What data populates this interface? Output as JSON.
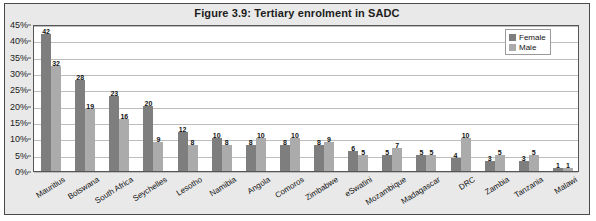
{
  "figure": {
    "title": "Figure 3.9: Tertiary enrolment in SADC"
  },
  "legend": {
    "position": "top-right",
    "entries": [
      {
        "label": "Female",
        "color": "#7e7e7e"
      },
      {
        "label": "Male",
        "color": "#ababab"
      }
    ]
  },
  "axis": {
    "y_ticks": [
      "0%",
      "5%",
      "10%",
      "15%",
      "20%",
      "25%",
      "30%",
      "35%",
      "40%",
      "45%"
    ]
  },
  "chart_data": {
    "type": "bar",
    "title": "Figure 3.9: Tertiary enrolment in SADC",
    "xlabel": "",
    "ylabel": "",
    "ylim": [
      0,
      45
    ],
    "ytick_step": 5,
    "ytick_suffix": "%",
    "grid": true,
    "legend_position": "top-right",
    "categories": [
      "Mauritius",
      "Botswana",
      "South Africa",
      "Seychelles",
      "Lesotho",
      "Namibia",
      "Angola",
      "Comoros",
      "Zimbabwe",
      "eSwatini",
      "Mozambique",
      "Madagascar",
      "DRC",
      "Zambia",
      "Tanzania",
      "Malawi"
    ],
    "series": [
      {
        "name": "Female",
        "color": "#7e7e7e",
        "values": [
          42,
          28,
          23,
          20,
          12,
          10,
          8,
          8,
          8,
          6,
          5,
          5,
          4,
          3,
          3,
          1
        ]
      },
      {
        "name": "Male",
        "color": "#ababab",
        "values": [
          32,
          19,
          16,
          9,
          8,
          8,
          10,
          10,
          9,
          5,
          7,
          5,
          10,
          5,
          5,
          1
        ]
      }
    ]
  }
}
